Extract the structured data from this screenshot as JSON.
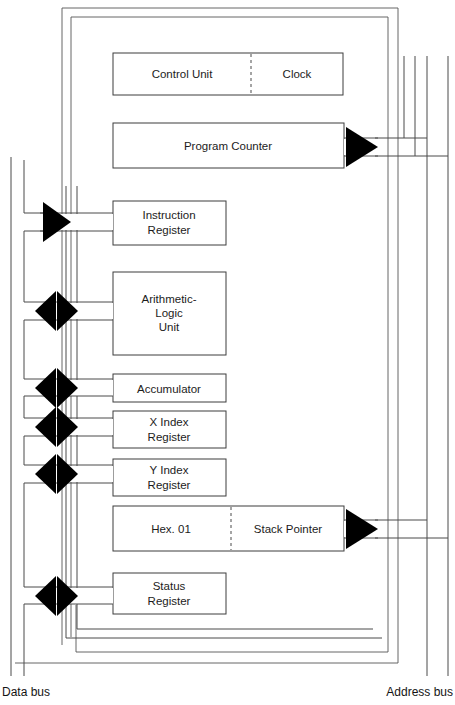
{
  "diagram": {
    "colors": {
      "line": "#3a3a3a",
      "box_fill": "#ffffff",
      "arrow_fill": "#000000",
      "text": "#1c1c1c",
      "background": "#ffffff"
    },
    "blocks": [
      {
        "id": "control-unit",
        "label": "Control Unit",
        "split_label": "Clock",
        "has_dashed_divider": true,
        "connector": "none"
      },
      {
        "id": "program-counter",
        "label": "Program Counter",
        "has_dashed_divider": false,
        "connector": "right-arrow"
      },
      {
        "id": "instruction-register",
        "label_line1": "Instruction",
        "label_line2": "Register",
        "connector": "left-in-arrow"
      },
      {
        "id": "arithmetic-logic-unit",
        "label_line1": "Arithmetic-",
        "label_line2": "Logic",
        "label_line3": "Unit",
        "connector": "bidirectional-arrow"
      },
      {
        "id": "accumulator",
        "label": "Accumulator",
        "connector": "bidirectional-arrow"
      },
      {
        "id": "x-index-register",
        "label_line1": "X Index",
        "label_line2": "Register",
        "connector": "bidirectional-arrow"
      },
      {
        "id": "y-index-register",
        "label_line1": "Y Index",
        "label_line2": "Register",
        "connector": "bidirectional-arrow"
      },
      {
        "id": "stack-pointer",
        "label": "Hex. 01",
        "split_label": "Stack Pointer",
        "has_dashed_divider": true,
        "connector": "right-arrow"
      },
      {
        "id": "status-register",
        "label_line1": "Status",
        "label_line2": "Register",
        "connector": "bidirectional-arrow"
      }
    ],
    "buses": {
      "data_bus_label": "Data bus",
      "address_bus_label": "Address bus"
    }
  }
}
